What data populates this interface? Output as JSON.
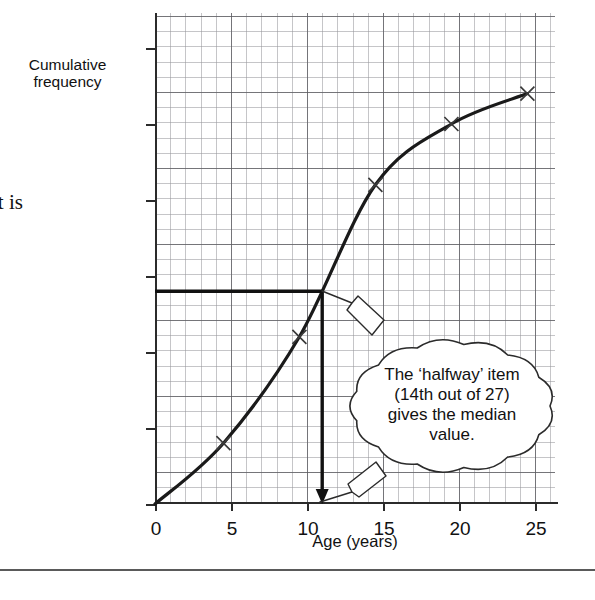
{
  "figure": {
    "y_axis_caption_line1": "Cumulative",
    "y_axis_caption_line2": "frequency",
    "x_axis_title": "Age (years)",
    "callout_line1": "The ‘halfway’ item",
    "callout_line2": "(14th out of 27)",
    "callout_line3": "gives the median",
    "callout_line4": "value.",
    "curve_color": "#1a1a1a",
    "grid_major_color": "#5a5a5f",
    "grid_minor_color": "#96969b"
  },
  "body_text": {
    "line1": "it is",
    "line2": "n"
  },
  "chart_data": {
    "type": "line",
    "title": "",
    "subtitle": "",
    "xlabel": "Age (years)",
    "ylabel": "Cumulative frequency",
    "xlim": [
      0,
      26.3
    ],
    "ylim": [
      0,
      32.3
    ],
    "xticks": [
      0,
      5,
      10,
      15,
      20,
      25
    ],
    "xtick_labels": [
      "0",
      "5",
      "10",
      "15",
      "20",
      "25"
    ],
    "yticks": [
      0,
      5,
      10,
      15,
      20,
      25,
      30
    ],
    "ytick_labels": [
      "0",
      "5",
      "10",
      "15",
      "20",
      "25",
      "30"
    ],
    "grid": true,
    "grid_minor_step": 1,
    "grid_major_step": 5,
    "legend": false,
    "marker": "x",
    "series": [
      {
        "name": "Cumulative frequency",
        "x": [
          0,
          4.5,
          9.5,
          14.5,
          19.5,
          24.5
        ],
        "y": [
          0,
          4,
          11,
          21,
          25,
          27
        ]
      }
    ],
    "annotations": [
      {
        "name": "median-horizontal-line",
        "type": "hline",
        "y": 14,
        "x_from": 0,
        "x_to": 11,
        "style": "thick-solid"
      },
      {
        "name": "median-vertical-arrow",
        "type": "vline-arrow",
        "x": 11,
        "y_from": 14,
        "y_to": 0,
        "style": "thick-solid-arrowhead"
      },
      {
        "name": "median-value",
        "type": "value",
        "value": 11,
        "label": "median age"
      },
      {
        "name": "halfway-item",
        "type": "value",
        "value": 14,
        "label": "14th of 27"
      }
    ]
  }
}
